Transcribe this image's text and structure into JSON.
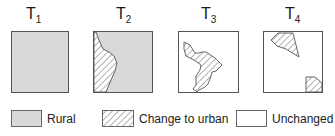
{
  "figure": {
    "panels": [
      {
        "id": "T1",
        "label": "T",
        "subscript": "1",
        "state": "all rural"
      },
      {
        "id": "T2",
        "label": "T",
        "subscript": "2",
        "state": "western strip changed to urban"
      },
      {
        "id": "T3",
        "label": "T",
        "subscript": "3",
        "state": "diagonal band changed to urban, rest unchanged"
      },
      {
        "id": "T4",
        "label": "T",
        "subscript": "4",
        "state": "two small patches changed to urban, rest unchanged"
      }
    ],
    "legend": [
      {
        "key": "rural",
        "label": "Rural",
        "fill": "#d9d9d9"
      },
      {
        "key": "change",
        "label": "Change to urban",
        "fill": "hatched"
      },
      {
        "key": "unchanged",
        "label": "Unchanged",
        "fill": "#ffffff"
      }
    ],
    "colors": {
      "rural": "#d9d9d9",
      "outline": "#555555",
      "hatch": "#555555",
      "background": "#ffffff"
    }
  }
}
